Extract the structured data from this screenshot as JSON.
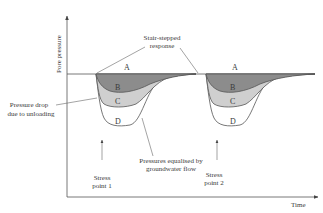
{
  "diagram": {
    "y_axis_label": "Pore pressure",
    "x_axis_label": "Time",
    "annotations": {
      "stair_stepped": [
        "Stair-stepped",
        "response"
      ],
      "pressure_drop": [
        "Pressure drop",
        "due to unloading"
      ],
      "equalised": [
        "Pressures equalised by",
        "groundwater flow"
      ]
    },
    "stress_points": [
      {
        "lines": [
          "Stress",
          "point 1"
        ]
      },
      {
        "lines": [
          "Stress",
          "point 2"
        ]
      }
    ],
    "zones": [
      "A",
      "B",
      "C",
      "D"
    ],
    "colors": {
      "zone_b": "#8c8c8c",
      "zone_c": "#cfcfcf",
      "zone_d": "#ffffff",
      "line": "#555555"
    }
  }
}
